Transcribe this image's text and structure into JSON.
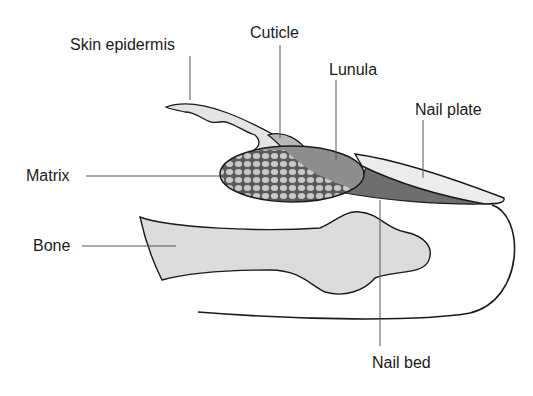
{
  "labels": {
    "skin_epidermis": "Skin epidermis",
    "cuticle": "Cuticle",
    "lunula": "Lunula",
    "nail_plate": "Nail plate",
    "matrix": "Matrix",
    "bone": "Bone",
    "nail_bed": "Nail bed"
  },
  "colors": {
    "outline": "#1a1a1a",
    "leader_line": "#555555",
    "skin": "#e4e4e4",
    "cuticle": "#b8b8b8",
    "lunula": "#8e8e8e",
    "nail_plate": "#ececec",
    "nail_bed": "#6e6e6e",
    "matrix_bg": "#5a5a5a",
    "matrix_cell": "#c8c8c8",
    "bone": "#dcdcdc"
  }
}
